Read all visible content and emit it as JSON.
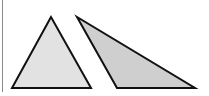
{
  "figure": {
    "width": 209,
    "height": 96,
    "background": "#ffffff",
    "border_color": "#8a8a8a",
    "stroke_color": "#111111",
    "stroke_width": 2,
    "shapes": [
      {
        "name": "left-triangle",
        "kind": "acute triangle",
        "fill": "#e2e2e2",
        "points": [
          [
            51,
            17
          ],
          [
            12,
            88
          ],
          [
            91,
            88
          ]
        ]
      },
      {
        "name": "right-triangle",
        "kind": "obtuse triangle",
        "fill": "#cfcfcf",
        "points": [
          [
            77,
            17
          ],
          [
            117,
            88
          ],
          [
            195,
            88
          ]
        ]
      }
    ]
  }
}
